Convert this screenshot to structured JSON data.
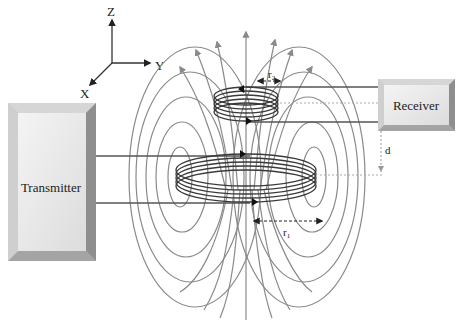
{
  "diagram": {
    "type": "inductive wireless power transfer coil diagram",
    "axes": {
      "z": "Z",
      "y": "Y",
      "x": "X"
    },
    "transmitter": {
      "label": "Transmitter"
    },
    "receiver": {
      "label": "Receiver"
    },
    "dimensions": {
      "receiver_radius": "r",
      "receiver_radius_sub": "2",
      "transmitter_radius": "r",
      "transmitter_radius_sub": "1",
      "distance": "d"
    },
    "colors": {
      "field_lines": "#8a8a8a",
      "coil": "#3a3a3a",
      "box_face": "#e8e8e8",
      "box_edge": "#9a9a9a"
    }
  }
}
